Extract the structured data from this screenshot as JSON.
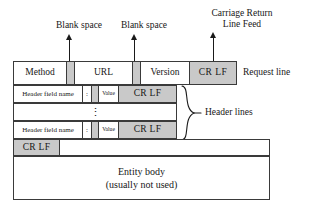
{
  "diagram": {
    "annotations": {
      "blank_space_1": "Blank space",
      "blank_space_2": "Blank space",
      "crlf_label_line1": "Carriage Return",
      "crlf_label_line2": "Line Feed"
    },
    "request_line": {
      "cells": [
        {
          "text": "Method",
          "style": "white"
        },
        {
          "text": "",
          "style": "gray"
        },
        {
          "text": "URL",
          "style": "white"
        },
        {
          "text": "",
          "style": "gray"
        },
        {
          "text": "Version",
          "style": "white"
        },
        {
          "text": "CR  LF",
          "style": "gray"
        }
      ],
      "label": "Request line"
    },
    "header_line_1": {
      "cells": [
        {
          "text": "Header field name",
          "style": "white"
        },
        {
          "text": ":",
          "style": "white"
        },
        {
          "text": "",
          "style": "gray"
        },
        {
          "text": "Value",
          "style": "white"
        },
        {
          "text": "CR LF",
          "style": "gray"
        }
      ]
    },
    "header_ellipsis_row": {
      "text": "⋮"
    },
    "header_line_n": {
      "cells": [
        {
          "text": "Header field name",
          "style": "white"
        },
        {
          "text": ":",
          "style": "white"
        },
        {
          "text": "",
          "style": "gray"
        },
        {
          "text": "Value",
          "style": "white"
        },
        {
          "text": "CR LF",
          "style": "gray"
        }
      ]
    },
    "header_lines_label": "Header lines",
    "blank_line": {
      "crlf_cell": "CR LF",
      "filler_cell": ""
    },
    "entity_body": {
      "line1": "Entity body",
      "line2": "(usually not used)"
    },
    "colors": {
      "gray_fill": "#c9c9c9",
      "border": "#3a3a3a",
      "background": "#ffffff",
      "text": "#171717"
    }
  }
}
